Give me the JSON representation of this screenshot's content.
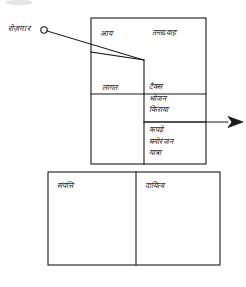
{
  "diagram": {
    "title_note": "rozgar-income-expense-assets-liabilities-chart",
    "external_label": "रोज़गार",
    "upper_box": {
      "income_cell": "आय",
      "income_detail": "तनख़्वाह",
      "cost_cell": "लागत",
      "expense_group_1": [
        "टैक्स",
        "भोजन",
        "किराया"
      ],
      "expense_group_2": [
        "कपड़े",
        "मनोरंजन",
        "यात्रा"
      ]
    },
    "lower_box": {
      "assets_cell": "संपत्ति",
      "liabilities_cell": "दायित्व"
    },
    "colors": {
      "ink": "#1a1a1a",
      "paper": "#ffffff",
      "smudge": "#cfcfcf"
    }
  }
}
